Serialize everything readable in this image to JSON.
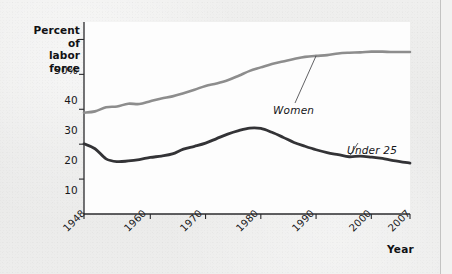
{
  "chart_data": {
    "type": "line",
    "title": "",
    "ylabel": "Percent of labor force",
    "xlabel": "Year",
    "ylim": [
      0,
      55
    ],
    "xlim": [
      1948,
      2007
    ],
    "grid": false,
    "legend_position": "inline-annotations",
    "ytick_labels": [
      "50%",
      "40",
      "30",
      "20",
      "10"
    ],
    "ytick_values": [
      50,
      40,
      30,
      20,
      10
    ],
    "xtick_labels": [
      "1948",
      "1960",
      "1970",
      "1980",
      "1990",
      "2000",
      "2007"
    ],
    "xtick_values": [
      1948,
      1960,
      1970,
      1980,
      1990,
      2000,
      2007
    ],
    "series": [
      {
        "name": "Women",
        "color": "#8d8d8d",
        "x": [
          1948,
          1950,
          1952,
          1954,
          1956,
          1958,
          1960,
          1962,
          1964,
          1966,
          1968,
          1970,
          1972,
          1974,
          1976,
          1978,
          1980,
          1982,
          1984,
          1986,
          1988,
          1990,
          1992,
          1994,
          1996,
          1998,
          2000,
          2002,
          2004,
          2007
        ],
        "values": [
          29.0,
          29.4,
          30.6,
          30.8,
          31.6,
          31.5,
          32.3,
          33.1,
          33.7,
          34.6,
          35.6,
          36.7,
          37.4,
          38.3,
          39.6,
          41.0,
          42.0,
          43.0,
          43.7,
          44.4,
          45.0,
          45.3,
          45.5,
          46.0,
          46.2,
          46.3,
          46.5,
          46.5,
          46.4,
          46.4
        ]
      },
      {
        "name": "Under 25",
        "color": "#333336",
        "x": [
          1948,
          1950,
          1952,
          1954,
          1956,
          1958,
          1960,
          1962,
          1964,
          1966,
          1968,
          1970,
          1972,
          1974,
          1976,
          1978,
          1980,
          1982,
          1984,
          1986,
          1988,
          1990,
          1992,
          1994,
          1996,
          1998,
          2000,
          2002,
          2004,
          2007
        ],
        "values": [
          20.1,
          18.7,
          15.8,
          15.0,
          15.2,
          15.6,
          16.2,
          16.6,
          17.2,
          18.6,
          19.4,
          20.3,
          21.6,
          22.9,
          23.9,
          24.6,
          24.5,
          23.4,
          22.0,
          20.5,
          19.4,
          18.4,
          17.6,
          17.0,
          16.4,
          16.6,
          16.3,
          15.9,
          15.3,
          14.6
        ]
      }
    ],
    "annotations": [
      {
        "text": "Women",
        "series": "Women",
        "label_x": 272,
        "label_y": 105
      },
      {
        "text": "Under 25",
        "series": "Under 25",
        "label_x": 346,
        "label_y": 145
      }
    ]
  },
  "axis": {
    "y_title_line1": "Percent of",
    "y_title_line2": "labor force",
    "x_title": "Year"
  },
  "colors": {
    "women_line": "#8d8d8d",
    "under25_line": "#333336",
    "axis": "#2a2a2d",
    "plot_bg": "#fdfdfd",
    "page_bg": "#ededec"
  }
}
